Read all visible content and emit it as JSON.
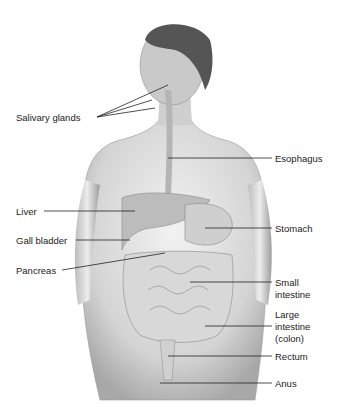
{
  "figure": {
    "labels_left": [
      {
        "id": "salivary",
        "text": "Salivary glands"
      },
      {
        "id": "liver",
        "text": "Liver"
      },
      {
        "id": "gall",
        "text": "Gall bladder"
      },
      {
        "id": "pancreas",
        "text": "Pancreas"
      }
    ],
    "labels_right": [
      {
        "id": "esophagus",
        "text": "Esophagus"
      },
      {
        "id": "stomach",
        "text": "Stomach"
      },
      {
        "id": "small1",
        "text": "Small"
      },
      {
        "id": "small2",
        "text": "intestine"
      },
      {
        "id": "large1",
        "text": "Large"
      },
      {
        "id": "large2",
        "text": "intestine"
      },
      {
        "id": "large3",
        "text": "(colon)"
      },
      {
        "id": "rectum",
        "text": "Rectum"
      },
      {
        "id": "anus",
        "text": "Anus"
      }
    ]
  }
}
